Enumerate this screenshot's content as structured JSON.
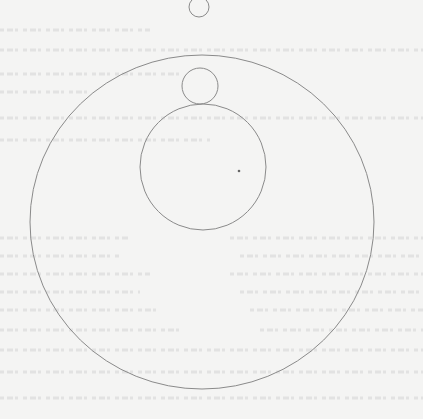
{
  "figure": {
    "type": "geometry-diagram",
    "stroke_color": "#8a8a8a",
    "background_color": "#f4f4f3",
    "shapes": [
      {
        "id": "top-small-circle",
        "kind": "circle",
        "cx": 199,
        "cy": 7,
        "r": 10
      },
      {
        "id": "large-circle",
        "kind": "ellipse",
        "cx": 202,
        "cy": 222,
        "rx": 172,
        "ry": 167
      },
      {
        "id": "inner-small-circle",
        "kind": "circle",
        "cx": 200,
        "cy": 86,
        "r": 18
      },
      {
        "id": "medium-circle",
        "kind": "circle",
        "cx": 203,
        "cy": 167,
        "r": 63
      },
      {
        "id": "center-dot",
        "kind": "dot",
        "cx": 239,
        "cy": 171,
        "r": 1.3
      }
    ]
  }
}
